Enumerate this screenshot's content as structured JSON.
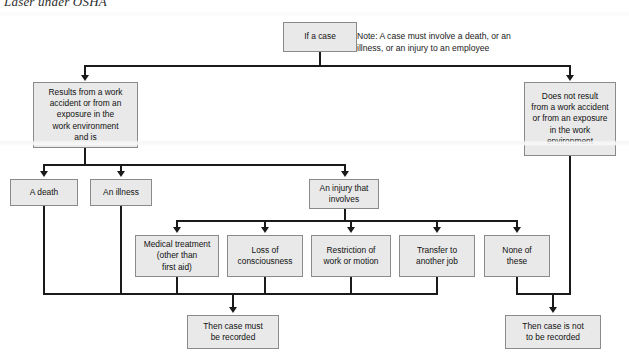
{
  "page": {
    "caption": "Laser under OSHA",
    "width": 629,
    "height": 359,
    "background": "#ffffff",
    "box_fill": "#e9e9e9",
    "box_border": "#8a8a8a",
    "connector_color": "#1a1a1a"
  },
  "note": {
    "text": "Note: A case must involve a death, or an\nillness, or an  injury to an employee"
  },
  "nodes": {
    "start": {
      "label": "If a case"
    },
    "work_related": {
      "label": "Results from a work\naccident or from an\nexposure in the\nwork environment\nand is"
    },
    "not_work_related": {
      "label": "Does not result\nfrom a work accident\nor from an exposure\nin the work\nenvironment"
    },
    "death": {
      "label": "A death"
    },
    "illness": {
      "label": "An illness"
    },
    "injury": {
      "label": "An injury that\ninvolves"
    },
    "medical_treatment": {
      "label": "Medical treatment\n(other than\nfirst aid)"
    },
    "loss_consciousness": {
      "label": "Loss of\nconsciousness"
    },
    "restriction": {
      "label": "Restriction of\nwork or motion"
    },
    "transfer": {
      "label": "Transfer to\nanother job"
    },
    "none_of_these": {
      "label": "None of\nthese"
    },
    "recordable": {
      "label": "Then case must\nbe recorded"
    },
    "not_recordable": {
      "label": "Then case is not\nto be recorded"
    }
  }
}
